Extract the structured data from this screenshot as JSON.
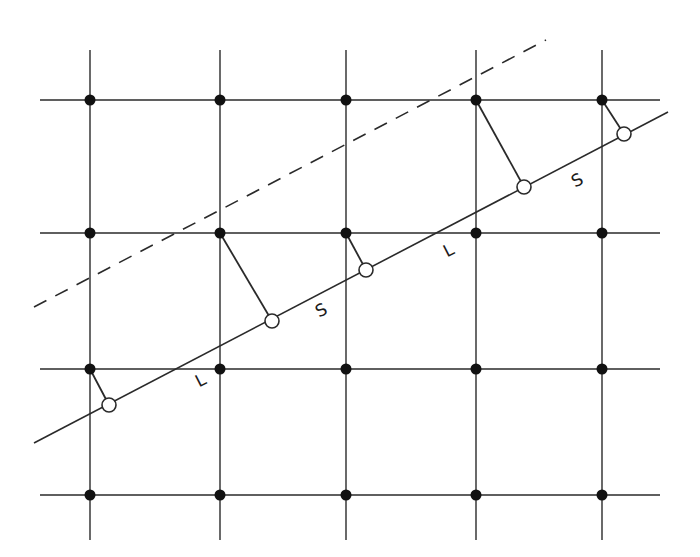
{
  "diagram": {
    "type": "lattice-projection",
    "stroke_color": "#2a2a2a",
    "grid": {
      "x_lines": [
        90,
        220,
        346,
        476,
        602
      ],
      "y_lines": [
        100,
        233,
        369,
        495
      ],
      "x_extent": [
        40,
        660
      ],
      "y_extent": [
        50,
        540
      ]
    },
    "solid_line": {
      "x1": 34,
      "y1": 443,
      "x2": 668,
      "y2": 112
    },
    "dashed_line": {
      "x1": 34,
      "y1": 307,
      "x2": 546,
      "y2": 40
    },
    "projections": [
      {
        "from": [
          90,
          369
        ],
        "to": [
          109,
          405
        ]
      },
      {
        "from": [
          220,
          233
        ],
        "to": [
          272,
          321
        ]
      },
      {
        "from": [
          346,
          233
        ],
        "to": [
          366,
          270
        ]
      },
      {
        "from": [
          476,
          100
        ],
        "to": [
          524,
          187
        ]
      },
      {
        "from": [
          602,
          100
        ],
        "to": [
          624,
          134
        ]
      }
    ],
    "labels": [
      {
        "text": "L",
        "x": 196,
        "y": 372
      },
      {
        "text": "S",
        "x": 316,
        "y": 302
      },
      {
        "text": "L",
        "x": 444,
        "y": 242
      },
      {
        "text": "S",
        "x": 572,
        "y": 172
      }
    ]
  }
}
